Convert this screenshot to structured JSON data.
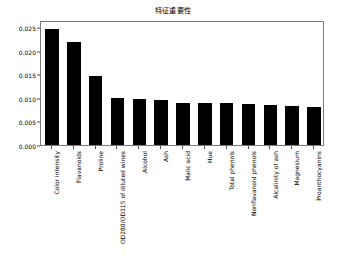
{
  "chart_data": {
    "type": "bar",
    "title": "特征重要性",
    "xlabel": "",
    "ylabel": "",
    "grid": false,
    "legend": null,
    "orientation": "vertical",
    "bar_color": "#000000",
    "frame_color": "#7a7a7a",
    "ylim": [
      0.0,
      0.0265
    ],
    "yticks": [
      "0.000",
      "0.005",
      "0.010",
      "0.015",
      "0.020",
      "0.025"
    ],
    "ytick_values": [
      0.0,
      0.005,
      0.01,
      0.015,
      0.02,
      0.025
    ],
    "categories": [
      "Color intensity",
      "Flavanoids",
      "Proline",
      "OD280/OD315 of diluted wines",
      "Alcohol",
      "Ash",
      "Malic acid",
      "Hue",
      "Total phenols",
      "Nonflavanoid phenols",
      "Alcalinity of ash",
      "Magnesium",
      "Proanthocyanins"
    ],
    "values": [
      0.0245,
      0.0218,
      0.0146,
      0.01,
      0.0098,
      0.0095,
      0.009,
      0.009,
      0.0089,
      0.0087,
      0.0085,
      0.0083,
      0.0081
    ]
  }
}
